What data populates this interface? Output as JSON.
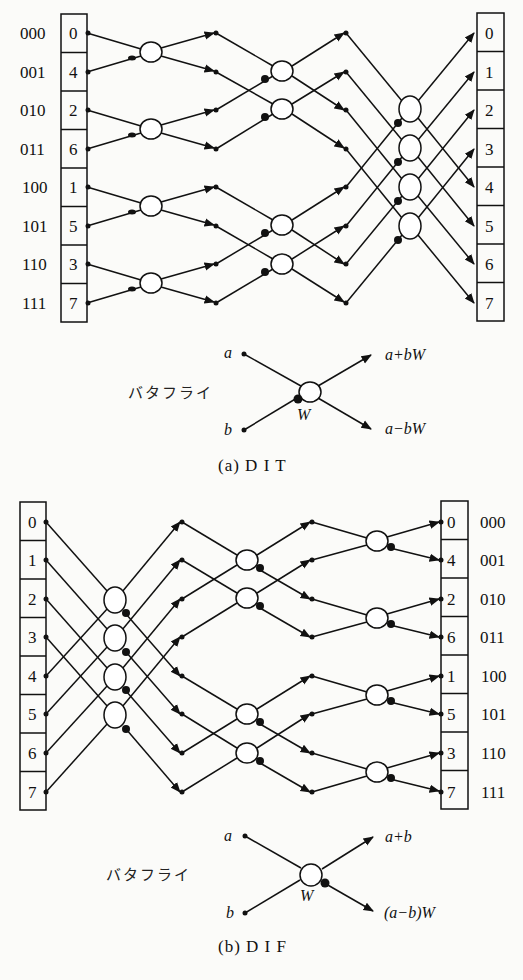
{
  "figure_a": {
    "caption": "(a)  D I T",
    "input_bits": [
      "000",
      "001",
      "010",
      "011",
      "100",
      "101",
      "110",
      "111"
    ],
    "input_indices": [
      "0",
      "4",
      "2",
      "6",
      "1",
      "5",
      "3",
      "7"
    ],
    "output_indices": [
      "0",
      "1",
      "2",
      "3",
      "4",
      "5",
      "6",
      "7"
    ],
    "butterfly_legend": {
      "label": "バタフライ",
      "input_a": "a",
      "input_b": "b",
      "twiddle": "W",
      "output_sum": "a+bW",
      "output_diff": "a−bW"
    }
  },
  "figure_b": {
    "caption": "(b)  D I F",
    "input_indices": [
      "0",
      "1",
      "2",
      "3",
      "4",
      "5",
      "6",
      "7"
    ],
    "output_indices": [
      "0",
      "4",
      "2",
      "6",
      "1",
      "5",
      "3",
      "7"
    ],
    "output_bits": [
      "000",
      "001",
      "010",
      "011",
      "100",
      "101",
      "110",
      "111"
    ],
    "butterfly_legend": {
      "label": "バタフライ",
      "input_a": "a",
      "input_b": "b",
      "twiddle": "W",
      "output_sum": "a+b",
      "output_diff": "(a−b)W"
    }
  },
  "colors": {
    "ink": "#111111",
    "paper": "#fbfbf9"
  }
}
